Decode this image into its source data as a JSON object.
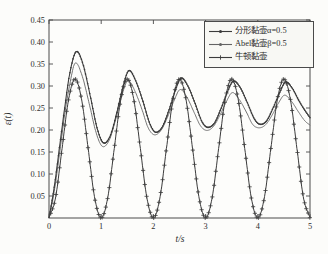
{
  "figure": {
    "background": "#fcfcfa",
    "frame_color": "#4a4a4a",
    "text_color": "#2e2e2e",
    "legend_background": "#f8f8f4",
    "legend_border": "#4a4a4a"
  },
  "chart_data": {
    "type": "line",
    "title": "",
    "xlabel": "t/s",
    "ylabel": "ε(t)",
    "xlim": [
      0,
      5
    ],
    "ylim": [
      0,
      0.45
    ],
    "xticks": [
      0,
      1,
      2,
      3,
      4,
      5
    ],
    "xtick_labels": [
      "0",
      "1",
      "2",
      "3",
      "4",
      "5"
    ],
    "yticks": [
      0.05,
      0.1,
      0.15,
      0.2,
      0.25,
      0.3,
      0.35,
      0.4,
      0.45
    ],
    "ytick_labels": [
      "0.05",
      "0.10",
      "0.15",
      "0.20",
      "0.25",
      "0.30",
      "0.35",
      "0.40",
      "0.45"
    ],
    "grid": false,
    "legend_position": "top-right",
    "series": [
      {
        "name": "分形黏壶α=0.5",
        "color": "#3b3b3b",
        "line_width": 1.1,
        "marker": "dot",
        "marker_step": 0.02,
        "marker_size": 0.8,
        "points": [
          [
            0,
            0
          ],
          [
            0.1,
            0.07
          ],
          [
            0.2,
            0.16
          ],
          [
            0.3,
            0.25
          ],
          [
            0.4,
            0.33
          ],
          [
            0.52,
            0.378
          ],
          [
            0.65,
            0.35
          ],
          [
            0.8,
            0.272
          ],
          [
            0.92,
            0.205
          ],
          [
            1.04,
            0.171
          ],
          [
            1.17,
            0.186
          ],
          [
            1.3,
            0.24
          ],
          [
            1.42,
            0.3
          ],
          [
            1.53,
            0.335
          ],
          [
            1.66,
            0.312
          ],
          [
            1.8,
            0.265
          ],
          [
            1.93,
            0.215
          ],
          [
            2.04,
            0.195
          ],
          [
            2.17,
            0.207
          ],
          [
            2.3,
            0.246
          ],
          [
            2.42,
            0.29
          ],
          [
            2.53,
            0.318
          ],
          [
            2.66,
            0.3
          ],
          [
            2.8,
            0.26
          ],
          [
            2.93,
            0.219
          ],
          [
            3.04,
            0.206
          ],
          [
            3.17,
            0.216
          ],
          [
            3.3,
            0.25
          ],
          [
            3.42,
            0.287
          ],
          [
            3.53,
            0.311
          ],
          [
            3.66,
            0.297
          ],
          [
            3.8,
            0.262
          ],
          [
            3.93,
            0.226
          ],
          [
            4.04,
            0.213
          ],
          [
            4.17,
            0.221
          ],
          [
            4.3,
            0.252
          ],
          [
            4.42,
            0.285
          ],
          [
            4.53,
            0.309
          ],
          [
            4.66,
            0.295
          ],
          [
            4.8,
            0.264
          ],
          [
            4.9,
            0.245
          ],
          [
            5,
            0.228
          ]
        ]
      },
      {
        "name": "Abel黏壶β=0.5",
        "color": "#636363",
        "line_width": 0.9,
        "marker": "dot",
        "marker_step": 0,
        "marker_size": 1.3,
        "points": [
          [
            0,
            0
          ],
          [
            0.1,
            0.06
          ],
          [
            0.2,
            0.145
          ],
          [
            0.3,
            0.235
          ],
          [
            0.4,
            0.305
          ],
          [
            0.5,
            0.352
          ],
          [
            0.63,
            0.325
          ],
          [
            0.78,
            0.255
          ],
          [
            0.9,
            0.195
          ],
          [
            1.02,
            0.163
          ],
          [
            1.15,
            0.176
          ],
          [
            1.28,
            0.225
          ],
          [
            1.4,
            0.28
          ],
          [
            1.51,
            0.312
          ],
          [
            1.64,
            0.29
          ],
          [
            1.78,
            0.247
          ],
          [
            1.9,
            0.205
          ],
          [
            2.02,
            0.189
          ],
          [
            2.15,
            0.2
          ],
          [
            2.28,
            0.232
          ],
          [
            2.4,
            0.268
          ],
          [
            2.51,
            0.292
          ],
          [
            2.64,
            0.275
          ],
          [
            2.78,
            0.24
          ],
          [
            2.9,
            0.21
          ],
          [
            3.02,
            0.199
          ],
          [
            3.15,
            0.208
          ],
          [
            3.28,
            0.235
          ],
          [
            3.4,
            0.265
          ],
          [
            3.51,
            0.285
          ],
          [
            3.64,
            0.27
          ],
          [
            3.78,
            0.241
          ],
          [
            3.9,
            0.213
          ],
          [
            4.02,
            0.205
          ],
          [
            4.15,
            0.212
          ],
          [
            4.28,
            0.235
          ],
          [
            4.4,
            0.262
          ],
          [
            4.51,
            0.279
          ],
          [
            4.64,
            0.266
          ],
          [
            4.78,
            0.241
          ],
          [
            4.9,
            0.221
          ],
          [
            5,
            0.211
          ]
        ]
      },
      {
        "name": "牛顿黏壶",
        "color": "#3b3b3b",
        "line_width": 1.0,
        "marker": "plus",
        "marker_step": 0.034,
        "marker_size": 2.1,
        "points": [
          [
            0,
            0
          ],
          [
            0.125,
            0.046
          ],
          [
            0.25,
            0.158
          ],
          [
            0.375,
            0.269
          ],
          [
            0.5,
            0.316
          ],
          [
            0.625,
            0.269
          ],
          [
            0.75,
            0.158
          ],
          [
            0.875,
            0.046
          ],
          [
            1,
            0
          ],
          [
            1.125,
            0.046
          ],
          [
            1.25,
            0.158
          ],
          [
            1.375,
            0.269
          ],
          [
            1.5,
            0.316
          ],
          [
            1.625,
            0.269
          ],
          [
            1.75,
            0.158
          ],
          [
            1.875,
            0.046
          ],
          [
            2,
            0
          ],
          [
            2.125,
            0.046
          ],
          [
            2.25,
            0.158
          ],
          [
            2.375,
            0.269
          ],
          [
            2.5,
            0.316
          ],
          [
            2.625,
            0.269
          ],
          [
            2.75,
            0.158
          ],
          [
            2.875,
            0.046
          ],
          [
            3,
            0
          ],
          [
            3.125,
            0.046
          ],
          [
            3.25,
            0.158
          ],
          [
            3.375,
            0.269
          ],
          [
            3.5,
            0.316
          ],
          [
            3.625,
            0.269
          ],
          [
            3.75,
            0.158
          ],
          [
            3.875,
            0.046
          ],
          [
            4,
            0
          ],
          [
            4.125,
            0.046
          ],
          [
            4.25,
            0.158
          ],
          [
            4.375,
            0.269
          ],
          [
            4.5,
            0.316
          ],
          [
            4.625,
            0.269
          ],
          [
            4.75,
            0.158
          ],
          [
            4.875,
            0.046
          ],
          [
            5,
            0
          ]
        ]
      }
    ]
  }
}
